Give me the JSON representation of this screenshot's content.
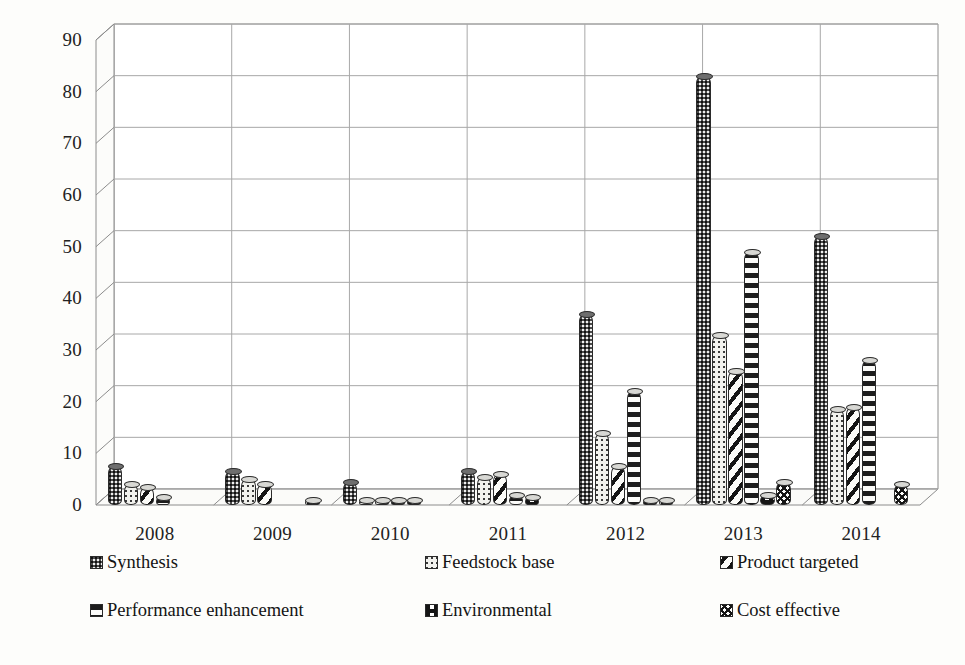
{
  "chart_data": {
    "type": "bar",
    "title": "",
    "subtitle": "",
    "xlabel": "",
    "ylabel": "",
    "categories": [
      "2008",
      "2009",
      "2010",
      "2011",
      "2012",
      "2013",
      "2014"
    ],
    "ylim": [
      0,
      90
    ],
    "yticks": [
      0,
      10,
      20,
      30,
      40,
      50,
      60,
      70,
      80,
      90
    ],
    "grid": true,
    "legend_position": "bottom",
    "three_d": true,
    "series": [
      {
        "name": "Synthesis",
        "pattern": "dark-checker",
        "values": [
          7.5,
          6.5,
          4.5,
          6.5,
          37,
          83,
          52
        ]
      },
      {
        "name": "Feedstock base",
        "pattern": "light-dots",
        "values": [
          4,
          5,
          1,
          5.5,
          14,
          33,
          18.5
        ]
      },
      {
        "name": "Product targeted",
        "pattern": "diagonal-stripes",
        "values": [
          3.5,
          4,
          1,
          6,
          7.5,
          26,
          19
        ]
      },
      {
        "name": "Performance enhancement",
        "pattern": "horizontal-dashes",
        "values": [
          1.5,
          0,
          1,
          2,
          22,
          49,
          28
        ]
      },
      {
        "name": "Environmental",
        "pattern": "half-block",
        "values": [
          0,
          0,
          1,
          1.5,
          1,
          2,
          0
        ]
      },
      {
        "name": "Cost effective",
        "pattern": "cross-hatch",
        "values": [
          0,
          1,
          0,
          0,
          1,
          4.5,
          4
        ]
      }
    ]
  },
  "legend": {
    "items": [
      {
        "label": "Synthesis"
      },
      {
        "label": "Feedstock base"
      },
      {
        "label": "Product targeted"
      },
      {
        "label": "Performance enhancement"
      },
      {
        "label": "Environmental"
      },
      {
        "label": "Cost effective"
      }
    ]
  },
  "colors": {
    "background": "#fdfdfb",
    "gridline": "#a8a8a8",
    "axis": "#8c8c8c",
    "text": "#1a1a1a",
    "bar_dark": "#4c4c4c",
    "bar_light": "#f2f2ee"
  }
}
